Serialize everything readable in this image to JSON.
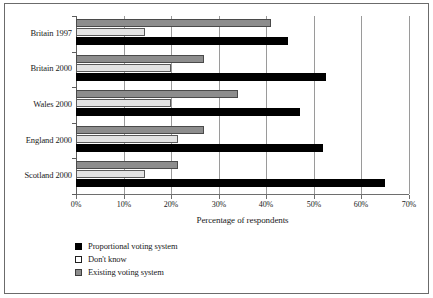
{
  "chart_data": {
    "type": "bar",
    "orientation": "horizontal",
    "title": "",
    "xlabel": "Percentage of respondents",
    "ylabel": "",
    "xlim": [
      0,
      70
    ],
    "xticks": [
      "0%",
      "10%",
      "20%",
      "30%",
      "40%",
      "50%",
      "60%",
      "70%"
    ],
    "xtick_values": [
      0,
      10,
      20,
      30,
      40,
      50,
      60,
      70
    ],
    "grid": true,
    "grid_axis": "x",
    "legend_position": "bottom-left",
    "categories": [
      "Britain 1997",
      "Britain 2000",
      "Wales 2000",
      "England 2000",
      "Scotland 2000"
    ],
    "series": [
      {
        "name": "Proportional voting system",
        "color": "#000000",
        "values": [
          44.5,
          52.5,
          47.0,
          52.0,
          65.0
        ]
      },
      {
        "name": "Don't know",
        "color": "#e3e3e3",
        "values": [
          14.5,
          20.0,
          20.0,
          21.5,
          14.5
        ]
      },
      {
        "name": "Existing voting system",
        "color": "#8d8d8d",
        "values": [
          41.0,
          27.0,
          34.0,
          27.0,
          21.5
        ]
      }
    ]
  },
  "legend": {
    "items": [
      {
        "label": "Proportional voting system",
        "swatch": "black"
      },
      {
        "label": "Don't know",
        "swatch": "light"
      },
      {
        "label": "Existing voting system",
        "swatch": "gray"
      }
    ]
  }
}
